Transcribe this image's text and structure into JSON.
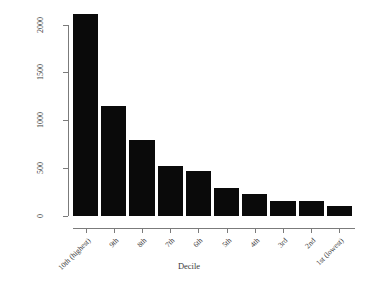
{
  "chart_data": {
    "type": "bar",
    "title": "",
    "xlabel": "Decile",
    "ylabel": "Number of Reviews",
    "categories": [
      "10th (highest)",
      "9th",
      "8th",
      "7th",
      "6th",
      "5th",
      "4th",
      "3rd",
      "2nd",
      "1st (lowest)"
    ],
    "values": [
      2110,
      1150,
      795,
      520,
      470,
      290,
      225,
      155,
      155,
      100
    ],
    "ylim": [
      0,
      2200
    ],
    "yticks": [
      0,
      500,
      1000,
      1500,
      2000
    ],
    "ytick_labels": [
      "0",
      "500",
      "1000",
      "1500",
      "2000"
    ],
    "grid": false,
    "legend": null,
    "bar_color": "#0a0a0a",
    "axis_color": "#7b7b7b",
    "xtick_label_rotation": 45,
    "ytick_label_rotation": 90
  },
  "axes": {
    "y_title": "Number of Reviews",
    "x_title": "Decile"
  }
}
